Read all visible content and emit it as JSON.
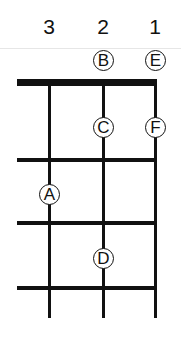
{
  "diagram": {
    "title": "",
    "string_labels": [
      "3",
      "2",
      "1"
    ],
    "notes": [
      {
        "label": "B",
        "string": 2,
        "fret": 0
      },
      {
        "label": "E",
        "string": 1,
        "fret": 0
      },
      {
        "label": "C",
        "string": 2,
        "fret": 1
      },
      {
        "label": "F",
        "string": 1,
        "fret": 1
      },
      {
        "label": "A",
        "string": 3,
        "fret": 2
      },
      {
        "label": "D",
        "string": 2,
        "fret": 3
      }
    ],
    "colors": {
      "line": "#111111",
      "background": "#ffffff"
    }
  }
}
